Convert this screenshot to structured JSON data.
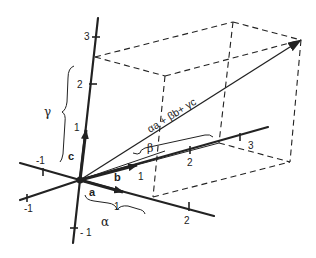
{
  "diagram": {
    "title": "",
    "colors": {
      "ink": "#222222",
      "background": "#ffffff"
    },
    "axes": {
      "c": {
        "vector_label": "c",
        "ticks": [
          "3",
          "2",
          "1",
          "- 1"
        ]
      },
      "a": {
        "vector_label": "a",
        "ticks": [
          "1",
          "2",
          "-1"
        ]
      },
      "b": {
        "vector_label": "b",
        "ticks": [
          "1",
          "2",
          "3",
          "-1"
        ]
      }
    },
    "resultant_label": "αa + βb+ γc",
    "braces": {
      "alpha": "α",
      "beta": "β",
      "gamma": "γ"
    },
    "tick_labels": {
      "c3": "3",
      "c2": "2",
      "c1": "1",
      "cm1": "- 1",
      "a1": "1",
      "a2": "2",
      "am1": "-1",
      "b1": "1",
      "b2": "2",
      "b3": "3",
      "bm1": "-1"
    }
  }
}
